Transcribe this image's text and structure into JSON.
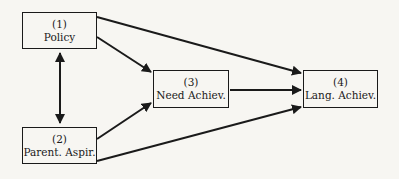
{
  "diagram": {
    "nodes": [
      {
        "id": "1",
        "number": "(1)",
        "label": "Policy"
      },
      {
        "id": "2",
        "number": "(2)",
        "label": "Parent. Aspir."
      },
      {
        "id": "3",
        "number": "(3)",
        "label": "Need Achiev."
      },
      {
        "id": "4",
        "number": "(4)",
        "label": "Lang. Achiev."
      }
    ],
    "edges": [
      {
        "from": "1",
        "to": "2",
        "type": "bidirectional"
      },
      {
        "from": "1",
        "to": "3",
        "type": "directed"
      },
      {
        "from": "1",
        "to": "4",
        "type": "directed"
      },
      {
        "from": "2",
        "to": "3",
        "type": "directed"
      },
      {
        "from": "2",
        "to": "4",
        "type": "directed"
      },
      {
        "from": "3",
        "to": "4",
        "type": "directed"
      }
    ]
  }
}
